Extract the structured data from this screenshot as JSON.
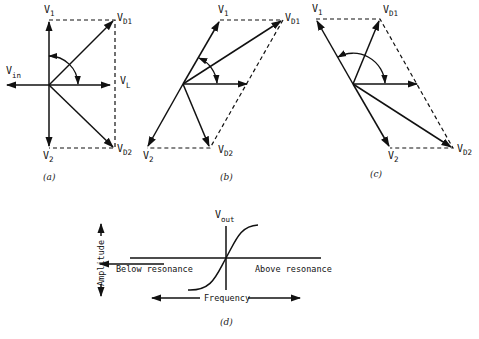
{
  "figure": {
    "panels": [
      {
        "id": "a",
        "caption": "(a)",
        "labels": {
          "v1": "V",
          "v1_sub": "1",
          "vd1": "V",
          "vd1_sub": "D1",
          "vin": "V",
          "vin_sub": "in",
          "vl": "V",
          "vl_sub": "L",
          "v2": "V",
          "v2_sub": "2",
          "vd2": "V",
          "vd2_sub": "D2"
        }
      },
      {
        "id": "b",
        "caption": "(b)",
        "labels": {
          "v1": "V",
          "v1_sub": "1",
          "vd1": "V",
          "vd1_sub": "D1",
          "v2": "V",
          "v2_sub": "2",
          "vd2": "V",
          "vd2_sub": "D2"
        }
      },
      {
        "id": "c",
        "caption": "(c)",
        "labels": {
          "v1": "V",
          "v1_sub": "1",
          "vd1": "V",
          "vd1_sub": "D1",
          "v2": "V",
          "v2_sub": "2",
          "vd2": "V",
          "vd2_sub": "D2"
        }
      },
      {
        "id": "d",
        "caption": "(d)",
        "labels": {
          "vout": "V",
          "vout_sub": "out",
          "amplitude": "Amplitude",
          "below": "Below resonance",
          "above": "Above resonance",
          "frequency": "Frequency"
        }
      }
    ],
    "colors": {
      "stroke": "#111111",
      "background": "#ffffff"
    }
  }
}
